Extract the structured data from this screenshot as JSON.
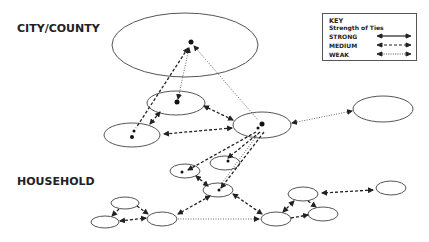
{
  "labels": {
    "city_county": "CITY/COUNTY",
    "household": "HOUSEHOLD"
  },
  "key": {
    "title": "KEY",
    "subtitle": "Strength of Ties",
    "rows": [
      {
        "label": "STRONG",
        "style": "solid"
      },
      {
        "label": "MEDIUM",
        "style": "dashed"
      },
      {
        "label": "WEAK",
        "style": "dotted"
      }
    ]
  },
  "diagram": {
    "type": "network",
    "levels": [
      "CITY/COUNTY",
      "HOUSEHOLD"
    ],
    "node_count": 15,
    "edge_types": [
      "strong",
      "medium",
      "weak"
    ]
  }
}
